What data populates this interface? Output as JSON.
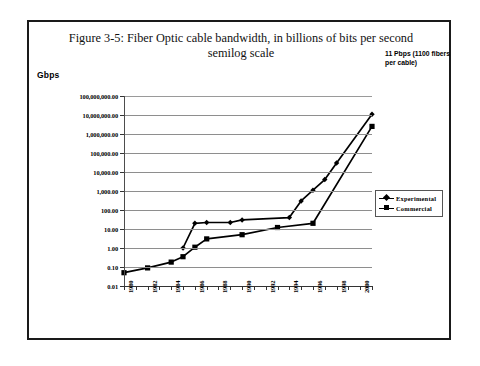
{
  "figure": {
    "title_line1": "Figure 3-5: Fiber Optic cable bandwidth, in billions of bits per second",
    "title_line2": "semilog scale",
    "unit_label": "Gbps",
    "annotation": "11 Pbps (1100 fibers per cable)"
  },
  "chart_data": {
    "type": "line",
    "title": "Figure 3-5: Fiber Optic cable bandwidth, in billions of bits per second semilog scale",
    "subtitle": "semilog scale",
    "xlabel": "",
    "ylabel": "Gbps",
    "yscale": "log",
    "ylim": [
      0.01,
      100000000.0
    ],
    "xlim": [
      1980,
      2001
    ],
    "grid": true,
    "legend_position": "right-inside-lower",
    "ytick_labels": [
      "100,000,000.00",
      "10,000,000.00",
      "1,000,000.00",
      "100,000.00",
      "10,000.00",
      "1,000.00",
      "100.00",
      "10.00",
      "1.00",
      "0.10",
      "0.01"
    ],
    "ytick_values": [
      100000000,
      10000000,
      1000000,
      100000,
      10000,
      1000,
      100,
      10,
      1,
      0.1,
      0.01
    ],
    "xtick_labels": [
      "1980",
      "1982",
      "1984",
      "1986",
      "1988",
      "1990",
      "1992",
      "1994",
      "1996",
      "1998",
      "2000"
    ],
    "xtick_values": [
      1980,
      1982,
      1984,
      1986,
      1988,
      1990,
      1992,
      1994,
      1996,
      1998,
      2000
    ],
    "xtick_minor_values": [
      1981,
      1983,
      1985,
      1987,
      1989,
      1991,
      1993,
      1995,
      1997,
      1999,
      2001
    ],
    "annotations": [
      {
        "text": "11 Pbps (1100 fibers per cable)",
        "x": 2001,
        "y": 11000000
      }
    ],
    "series": [
      {
        "name": "Experimental",
        "marker": "diamond",
        "color": "#000000",
        "points": [
          {
            "x": 1985,
            "y": 1.0
          },
          {
            "x": 1986,
            "y": 20.0
          },
          {
            "x": 1987,
            "y": 22.0
          },
          {
            "x": 1989,
            "y": 22.0
          },
          {
            "x": 1990,
            "y": 30.0
          },
          {
            "x": 1994,
            "y": 40.0
          },
          {
            "x": 1995,
            "y": 300.0
          },
          {
            "x": 1996,
            "y": 1100.0
          },
          {
            "x": 1997,
            "y": 4000.0
          },
          {
            "x": 1998,
            "y": 30000.0
          },
          {
            "x": 2001,
            "y": 11000000.0
          }
        ]
      },
      {
        "name": "Commercial",
        "marker": "square",
        "color": "#000000",
        "points": [
          {
            "x": 1980,
            "y": 0.05
          },
          {
            "x": 1982,
            "y": 0.09
          },
          {
            "x": 1984,
            "y": 0.18
          },
          {
            "x": 1985,
            "y": 0.35
          },
          {
            "x": 1986,
            "y": 1.1
          },
          {
            "x": 1987,
            "y": 3.0
          },
          {
            "x": 1990,
            "y": 5.0
          },
          {
            "x": 1993,
            "y": 12.0
          },
          {
            "x": 1996,
            "y": 20.0
          },
          {
            "x": 2001,
            "y": 2500000.0
          }
        ]
      }
    ]
  }
}
